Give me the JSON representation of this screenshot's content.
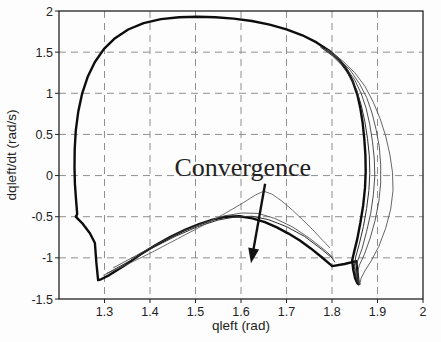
{
  "chart_data": {
    "type": "line",
    "title": "",
    "xlabel": "qleft (rad)",
    "ylabel": "dqleft/dt (rad/s)",
    "xlim": [
      1.2,
      2.0
    ],
    "ylim": [
      -1.5,
      2.0
    ],
    "xticks": {
      "values": [
        1.3,
        1.4,
        1.5,
        1.6,
        1.7,
        1.8,
        1.9,
        2.0
      ],
      "labels": [
        "1.3",
        "1.4",
        "1.5",
        "1.6",
        "1.7",
        "1.8",
        "1.9",
        "2"
      ]
    },
    "yticks": {
      "values": [
        -1.5,
        -1.0,
        -0.5,
        0.0,
        0.5,
        1.0,
        1.5,
        2.0
      ],
      "labels": [
        "-1.5",
        "-1",
        "-0.5",
        "0",
        "0.5",
        "1",
        "1.5",
        "2"
      ]
    },
    "grid": {
      "show": true,
      "style": "dashed",
      "color": "#8f8f8f",
      "dash": "7,5"
    },
    "axis": {
      "color": "#222222",
      "tick_len": 4
    },
    "legend": {
      "show": false
    },
    "annotation": {
      "text": "Convergence",
      "font_size_px": 26,
      "color": "#111111",
      "anchor": {
        "q": 1.604,
        "dq": -0.01
      },
      "arrow": {
        "from": {
          "q": 1.653,
          "dq": -0.1
        },
        "to": {
          "q": 1.622,
          "dq": -1.065
        }
      }
    },
    "series": [
      {
        "name": "limit-cycle",
        "color": "#0d0d0d",
        "width": 2.4,
        "points": [
          [
            1.286,
            -1.27
          ],
          [
            1.282,
            -1.05
          ],
          [
            1.279,
            -0.82
          ],
          [
            1.268,
            -0.7
          ],
          [
            1.252,
            -0.585
          ],
          [
            1.243,
            -0.535
          ],
          [
            1.237,
            -0.5
          ],
          [
            1.24,
            -0.47
          ],
          [
            1.2375,
            -0.3
          ],
          [
            1.235,
            -0.1
          ],
          [
            1.234,
            0.1
          ],
          [
            1.2345,
            0.32
          ],
          [
            1.237,
            0.55
          ],
          [
            1.2425,
            0.78
          ],
          [
            1.251,
            1.0
          ],
          [
            1.263,
            1.2
          ],
          [
            1.279,
            1.38
          ],
          [
            1.299,
            1.54
          ],
          [
            1.323,
            1.67
          ],
          [
            1.352,
            1.775
          ],
          [
            1.386,
            1.853
          ],
          [
            1.424,
            1.902
          ],
          [
            1.464,
            1.925
          ],
          [
            1.504,
            1.93
          ],
          [
            1.544,
            1.925
          ],
          [
            1.584,
            1.908
          ],
          [
            1.624,
            1.878
          ],
          [
            1.663,
            1.835
          ],
          [
            1.7,
            1.778
          ],
          [
            1.735,
            1.705
          ],
          [
            1.766,
            1.618
          ],
          [
            1.793,
            1.52
          ],
          [
            1.8155,
            1.41
          ],
          [
            1.8325,
            1.285
          ],
          [
            1.8455,
            1.145
          ],
          [
            1.8555,
            0.985
          ],
          [
            1.8625,
            0.815
          ],
          [
            1.8675,
            0.635
          ],
          [
            1.871,
            0.445
          ],
          [
            1.8735,
            0.25
          ],
          [
            1.874,
            0.05
          ],
          [
            1.8725,
            -0.15
          ],
          [
            1.8685,
            -0.36
          ],
          [
            1.8625,
            -0.57
          ],
          [
            1.8555,
            -0.77
          ],
          [
            1.8485,
            -0.93
          ],
          [
            1.8445,
            -1.03
          ],
          [
            1.8465,
            -1.14
          ],
          [
            1.851,
            -1.25
          ],
          [
            1.856,
            -1.31
          ],
          [
            1.8585,
            -1.32
          ],
          [
            1.857,
            -1.22
          ],
          [
            1.8545,
            -1.1
          ],
          [
            1.8535,
            -1.04
          ],
          [
            1.8275,
            -1.075
          ],
          [
            1.8005,
            -1.1
          ],
          [
            1.777,
            -0.99
          ],
          [
            1.7535,
            -0.885
          ],
          [
            1.7295,
            -0.79
          ],
          [
            1.7045,
            -0.705
          ],
          [
            1.679,
            -0.63
          ],
          [
            1.6525,
            -0.565
          ],
          [
            1.625,
            -0.52
          ],
          [
            1.5965,
            -0.495
          ],
          [
            1.5675,
            -0.5
          ],
          [
            1.538,
            -0.535
          ],
          [
            1.508,
            -0.59
          ],
          [
            1.477,
            -0.66
          ],
          [
            1.445,
            -0.745
          ],
          [
            1.4125,
            -0.845
          ],
          [
            1.379,
            -0.96
          ],
          [
            1.345,
            -1.09
          ],
          [
            1.3105,
            -1.21
          ],
          [
            1.2925,
            -1.26
          ],
          [
            1.286,
            -1.27
          ]
        ]
      },
      {
        "name": "transient-right-1",
        "color": "#2e2e2e",
        "width": 1.0,
        "points": [
          [
            1.775,
            1.56
          ],
          [
            1.8,
            1.46
          ],
          [
            1.822,
            1.34
          ],
          [
            1.84,
            1.2
          ],
          [
            1.854,
            1.04
          ],
          [
            1.864,
            0.86
          ],
          [
            1.872,
            0.66
          ],
          [
            1.878,
            0.45
          ],
          [
            1.882,
            0.24
          ],
          [
            1.883,
            0.03
          ],
          [
            1.881,
            -0.18
          ],
          [
            1.876,
            -0.4
          ],
          [
            1.869,
            -0.62
          ],
          [
            1.86,
            -0.83
          ],
          [
            1.852,
            -0.99
          ],
          [
            1.849,
            -1.1
          ],
          [
            1.852,
            -1.22
          ],
          [
            1.857,
            -1.3
          ],
          [
            1.859,
            -1.32
          ]
        ]
      },
      {
        "name": "transient-right-2",
        "color": "#3a3a3a",
        "width": 0.9,
        "points": [
          [
            1.78,
            1.55
          ],
          [
            1.808,
            1.44
          ],
          [
            1.831,
            1.31
          ],
          [
            1.85,
            1.16
          ],
          [
            1.864,
            1.0
          ],
          [
            1.875,
            0.82
          ],
          [
            1.883,
            0.62
          ],
          [
            1.889,
            0.41
          ],
          [
            1.893,
            0.2
          ],
          [
            1.894,
            -0.01
          ],
          [
            1.891,
            -0.23
          ],
          [
            1.885,
            -0.46
          ],
          [
            1.876,
            -0.68
          ],
          [
            1.866,
            -0.89
          ],
          [
            1.856,
            -1.04
          ],
          [
            1.852,
            -1.14
          ],
          [
            1.855,
            -1.25
          ],
          [
            1.859,
            -1.31
          ],
          [
            1.86,
            -1.32
          ]
        ]
      },
      {
        "name": "transient-right-3",
        "color": "#474747",
        "width": 0.9,
        "points": [
          [
            1.785,
            1.54
          ],
          [
            1.815,
            1.42
          ],
          [
            1.84,
            1.28
          ],
          [
            1.86,
            1.12
          ],
          [
            1.876,
            0.95
          ],
          [
            1.888,
            0.76
          ],
          [
            1.897,
            0.56
          ],
          [
            1.904,
            0.35
          ],
          [
            1.907,
            0.13
          ],
          [
            1.907,
            -0.09
          ],
          [
            1.903,
            -0.31
          ],
          [
            1.895,
            -0.54
          ],
          [
            1.884,
            -0.76
          ],
          [
            1.871,
            -0.96
          ],
          [
            1.86,
            -1.09
          ],
          [
            1.856,
            -1.18
          ],
          [
            1.858,
            -1.26
          ],
          [
            1.861,
            -1.32
          ]
        ]
      },
      {
        "name": "transient-right-4",
        "color": "#555555",
        "width": 0.9,
        "points": [
          [
            1.79,
            1.53
          ],
          [
            1.822,
            1.4
          ],
          [
            1.85,
            1.25
          ],
          [
            1.873,
            1.08
          ],
          [
            1.891,
            0.89
          ],
          [
            1.906,
            0.69
          ],
          [
            1.918,
            0.48
          ],
          [
            1.927,
            0.26
          ],
          [
            1.933,
            0.04
          ],
          [
            1.934,
            -0.18
          ],
          [
            1.929,
            -0.41
          ],
          [
            1.918,
            -0.64
          ],
          [
            1.903,
            -0.86
          ],
          [
            1.886,
            -1.04
          ],
          [
            1.872,
            -1.16
          ],
          [
            1.864,
            -1.25
          ],
          [
            1.862,
            -1.3
          ],
          [
            1.862,
            -1.32
          ]
        ]
      },
      {
        "name": "transient-bottom-1",
        "color": "#2e2e2e",
        "width": 1.0,
        "points": [
          [
            1.305,
            -1.19
          ],
          [
            1.355,
            -1.04
          ],
          [
            1.405,
            -0.88
          ],
          [
            1.455,
            -0.74
          ],
          [
            1.505,
            -0.62
          ],
          [
            1.55,
            -0.54
          ],
          [
            1.59,
            -0.5
          ],
          [
            1.625,
            -0.495
          ],
          [
            1.66,
            -0.535
          ],
          [
            1.7,
            -0.62
          ],
          [
            1.74,
            -0.74
          ],
          [
            1.778,
            -0.9
          ],
          [
            1.8,
            -1.0
          ],
          [
            1.806,
            -1.05
          ]
        ]
      },
      {
        "name": "transient-bottom-2",
        "color": "#444444",
        "width": 0.85,
        "points": [
          [
            1.32,
            -1.12
          ],
          [
            1.37,
            -0.97
          ],
          [
            1.42,
            -0.82
          ],
          [
            1.47,
            -0.68
          ],
          [
            1.52,
            -0.57
          ],
          [
            1.563,
            -0.49
          ],
          [
            1.602,
            -0.455
          ],
          [
            1.638,
            -0.46
          ],
          [
            1.674,
            -0.52
          ],
          [
            1.712,
            -0.62
          ],
          [
            1.75,
            -0.76
          ],
          [
            1.785,
            -0.91
          ],
          [
            1.803,
            -1.0
          ]
        ]
      },
      {
        "name": "transient-bottom-outer",
        "color": "#555555",
        "width": 0.85,
        "points": [
          [
            1.298,
            -1.21
          ],
          [
            1.35,
            -1.08
          ],
          [
            1.405,
            -0.93
          ],
          [
            1.46,
            -0.77
          ],
          [
            1.515,
            -0.61
          ],
          [
            1.565,
            -0.46
          ],
          [
            1.605,
            -0.33
          ],
          [
            1.632,
            -0.235
          ],
          [
            1.65,
            -0.19
          ],
          [
            1.668,
            -0.225
          ],
          [
            1.69,
            -0.31
          ],
          [
            1.713,
            -0.42
          ],
          [
            1.736,
            -0.54
          ],
          [
            1.758,
            -0.66
          ],
          [
            1.78,
            -0.79
          ],
          [
            1.795,
            -0.875
          ]
        ]
      }
    ]
  }
}
